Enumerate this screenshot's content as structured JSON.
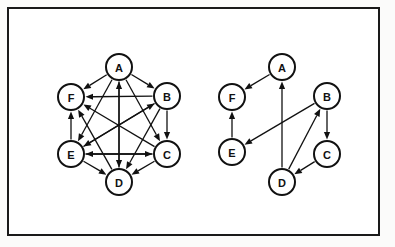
{
  "figure": {
    "background_color": "#ffffff",
    "frame_color": "#1a1a1a",
    "node_fill": "#ffffff",
    "node_stroke": "#111111",
    "edge_color": "#111111",
    "node_radius": 13
  },
  "graphs": [
    {
      "id": "left-graph",
      "name": "dense-directed-graph",
      "nodes": [
        {
          "id": "A",
          "label": "A",
          "x": 119,
          "y": 67
        },
        {
          "id": "B",
          "label": "B",
          "x": 167,
          "y": 96
        },
        {
          "id": "C",
          "label": "C",
          "x": 167,
          "y": 154
        },
        {
          "id": "D",
          "label": "D",
          "x": 119,
          "y": 182
        },
        {
          "id": "E",
          "label": "E",
          "x": 71,
          "y": 154
        },
        {
          "id": "F",
          "label": "F",
          "x": 71,
          "y": 97
        }
      ],
      "edges": [
        {
          "from": "A",
          "to": "F"
        },
        {
          "from": "A",
          "to": "B"
        },
        {
          "from": "A",
          "to": "C"
        },
        {
          "from": "A",
          "to": "D"
        },
        {
          "from": "A",
          "to": "E"
        },
        {
          "from": "B",
          "to": "F"
        },
        {
          "from": "B",
          "to": "C"
        },
        {
          "from": "B",
          "to": "D"
        },
        {
          "from": "B",
          "to": "E"
        },
        {
          "from": "C",
          "to": "F"
        },
        {
          "from": "C",
          "to": "D"
        },
        {
          "from": "C",
          "to": "E"
        },
        {
          "from": "D",
          "to": "F"
        },
        {
          "from": "D",
          "to": "A"
        },
        {
          "from": "E",
          "to": "F"
        },
        {
          "from": "E",
          "to": "B"
        },
        {
          "from": "E",
          "to": "C"
        },
        {
          "from": "E",
          "to": "D"
        }
      ]
    },
    {
      "id": "right-graph",
      "name": "sparse-directed-graph",
      "nodes": [
        {
          "id": "A",
          "label": "A",
          "x": 282,
          "y": 67
        },
        {
          "id": "B",
          "label": "B",
          "x": 327,
          "y": 96
        },
        {
          "id": "C",
          "label": "C",
          "x": 327,
          "y": 154
        },
        {
          "id": "D",
          "label": "D",
          "x": 282,
          "y": 182
        },
        {
          "id": "E",
          "label": "E",
          "x": 232,
          "y": 152
        },
        {
          "id": "F",
          "label": "F",
          "x": 232,
          "y": 97
        }
      ],
      "edges": [
        {
          "from": "A",
          "to": "F"
        },
        {
          "from": "E",
          "to": "F"
        },
        {
          "from": "D",
          "to": "A"
        },
        {
          "from": "B",
          "to": "E"
        },
        {
          "from": "B",
          "to": "C"
        },
        {
          "from": "C",
          "to": "D"
        },
        {
          "from": "D",
          "to": "B"
        }
      ]
    }
  ]
}
